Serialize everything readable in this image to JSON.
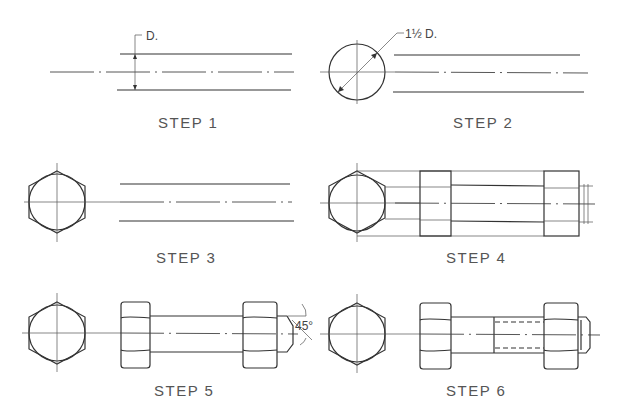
{
  "steps": [
    {
      "id": 1,
      "label": "STEP 1",
      "annotation": "D."
    },
    {
      "id": 2,
      "label": "STEP 2",
      "annotation": "1½ D."
    },
    {
      "id": 3,
      "label": "STEP 3"
    },
    {
      "id": 4,
      "label": "STEP 4"
    },
    {
      "id": 5,
      "label": "STEP 5",
      "annotation": "45°"
    },
    {
      "id": 6,
      "label": "STEP 6"
    }
  ],
  "colors": {
    "line": "#333333",
    "text": "#555555",
    "background": "#ffffff"
  }
}
